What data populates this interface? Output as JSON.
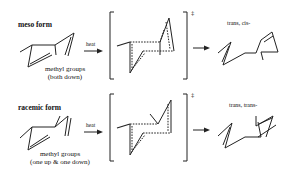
{
  "diagram": {
    "type": "reaction-scheme",
    "topic": "Cope rearrangement stereochemistry via chair transition state",
    "rows": [
      {
        "id": "meso",
        "title": "meso form",
        "substituent_note_line1": "methyl groups",
        "substituent_note_line2": "(both down)",
        "condition": "heat",
        "transition_state_mark": "‡",
        "product_label": "trans, cis-"
      },
      {
        "id": "racemic",
        "title": "racemic form",
        "substituent_note_line1": "methyl groups",
        "substituent_note_line2": "(one up & one down)",
        "condition": "heat",
        "transition_state_mark": "‡",
        "product_label": "trans, trans-"
      }
    ],
    "colors": {
      "line": "#222222",
      "background": "#ffffff"
    }
  }
}
